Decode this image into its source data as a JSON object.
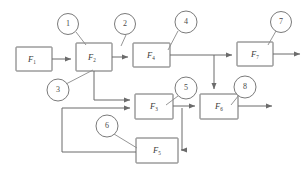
{
  "diagram": {
    "stroke_color": "#6b6b6b",
    "lead_color": "#8a8a8a",
    "background": "#ffffff",
    "blocks": [
      {
        "id": "F1",
        "base": "F",
        "sub": "1",
        "x": 16,
        "y": 47,
        "w": 36,
        "h": 24
      },
      {
        "id": "F2",
        "base": "F",
        "sub": "2",
        "x": 76,
        "y": 43,
        "w": 36,
        "h": 28
      },
      {
        "id": "F4",
        "base": "F",
        "sub": "4",
        "x": 133,
        "y": 43,
        "w": 37,
        "h": 24
      },
      {
        "id": "F7",
        "base": "F",
        "sub": "7",
        "x": 237,
        "y": 42,
        "w": 36,
        "h": 24
      },
      {
        "id": "F3",
        "base": "F",
        "sub": "3",
        "x": 135,
        "y": 94,
        "w": 38,
        "h": 25
      },
      {
        "id": "F6",
        "base": "F",
        "sub": "6",
        "x": 200,
        "y": 94,
        "w": 38,
        "h": 25
      },
      {
        "id": "F5",
        "base": "F",
        "sub": "5",
        "x": 136,
        "y": 138,
        "w": 42,
        "h": 25
      }
    ],
    "callouts": [
      {
        "label": "1",
        "cx": 68,
        "cy": 24,
        "r": 10.5,
        "tip_x": 84,
        "tip_y": 44
      },
      {
        "label": "2",
        "cx": 125,
        "cy": 24,
        "r": 10.5,
        "tip_x": 120,
        "tip_y": 44
      },
      {
        "label": "4",
        "cx": 186,
        "cy": 22,
        "r": 11,
        "tip_x": 172,
        "tip_y": 52
      },
      {
        "label": "7",
        "cx": 281,
        "cy": 22,
        "r": 10.5,
        "tip_x": 270,
        "tip_y": 44
      },
      {
        "label": "3",
        "cx": 58,
        "cy": 90,
        "r": 11,
        "tip_x": 92,
        "tip_y": 71
      },
      {
        "label": "5",
        "cx": 186,
        "cy": 88,
        "r": 11,
        "tip_x": 170,
        "tip_y": 104
      },
      {
        "label": "8",
        "cx": 245,
        "cy": 87,
        "r": 11,
        "tip_x": 235,
        "tip_y": 104
      },
      {
        "label": "6",
        "cx": 107,
        "cy": 126,
        "r": 11,
        "tip_x": 135,
        "tip_y": 147
      }
    ],
    "edges": [
      {
        "name": "f1-to-f2",
        "from": "F1",
        "to": "F2"
      },
      {
        "name": "f2-to-f4",
        "from": "F2",
        "to": "F4"
      },
      {
        "name": "f4-to-f7-bus",
        "from": "F4",
        "to": "F7"
      },
      {
        "name": "f7-output",
        "from": "F7",
        "to": "out"
      },
      {
        "name": "f2-branch-to-f3",
        "from": "F2",
        "to": "F3"
      },
      {
        "name": "f4bus-down-to-f6",
        "from": "F4",
        "to": "F6"
      },
      {
        "name": "f3-to-f6",
        "from": "F3",
        "to": "F6"
      },
      {
        "name": "f6-output",
        "from": "F6",
        "to": "out"
      },
      {
        "name": "f3-to-f5",
        "from": "F3",
        "to": "F5"
      },
      {
        "name": "f5-feedback-f3",
        "from": "F5",
        "to": "F3"
      }
    ]
  }
}
